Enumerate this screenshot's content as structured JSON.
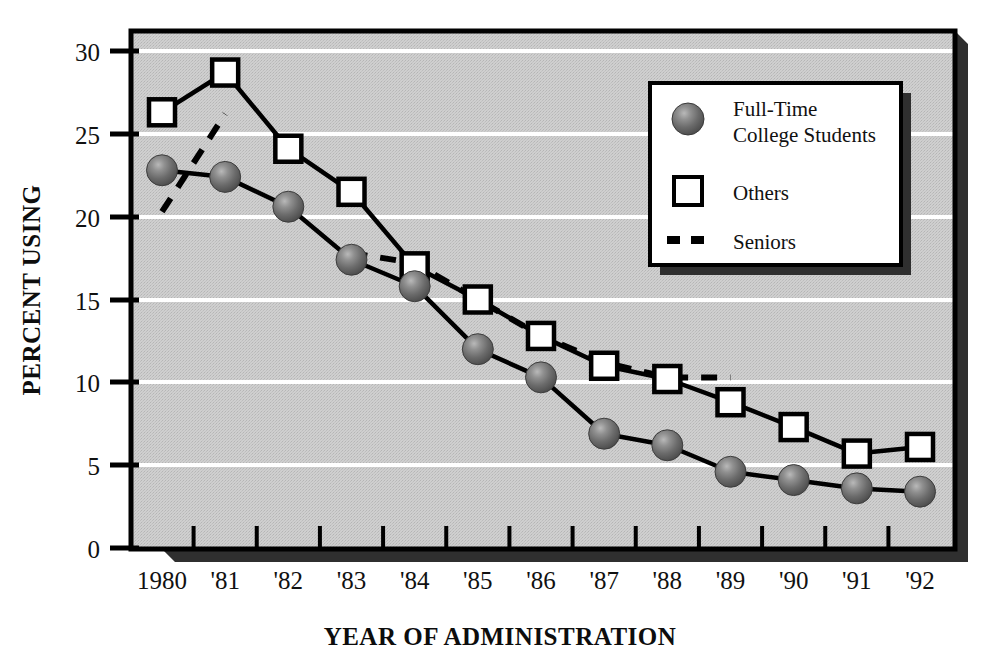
{
  "chart_data": {
    "type": "line",
    "title": "",
    "xlabel": "YEAR OF ADMINISTRATION",
    "ylabel": "PERCENT USING",
    "categories": [
      "1980",
      "'81",
      "'82",
      "'83",
      "'84",
      "'85",
      "'86",
      "'87",
      "'88",
      "'89",
      "'90",
      "'91",
      "'92"
    ],
    "x": [
      1980,
      1981,
      1982,
      1983,
      1984,
      1985,
      1986,
      1987,
      1988,
      1989,
      1990,
      1991,
      1992
    ],
    "ylim": [
      0,
      30
    ],
    "yticks": [
      0,
      5,
      10,
      15,
      20,
      25,
      30
    ],
    "ytick_labels": [
      "0",
      "5",
      "10",
      "15",
      "20",
      "25",
      "30"
    ],
    "grid": "horizontal-white",
    "legend_position": "upper-right-inset",
    "series": [
      {
        "name": "Full-Time College Students",
        "marker": "filled-sphere",
        "line": "solid",
        "values": [
          22.8,
          22.4,
          20.6,
          17.4,
          15.8,
          12.0,
          10.3,
          6.9,
          6.2,
          4.6,
          4.1,
          3.6,
          3.4
        ]
      },
      {
        "name": "Others",
        "marker": "open-square",
        "line": "solid",
        "values": [
          26.3,
          28.7,
          24.1,
          21.5,
          17.0,
          15.0,
          12.8,
          11.0,
          10.2,
          8.8,
          7.3,
          5.7,
          6.1
        ]
      },
      {
        "name": "Seniors",
        "marker": "none",
        "line": "dashed",
        "values": [
          20.3,
          26.2,
          null,
          17.8,
          17.2,
          15.0,
          12.8,
          11.2,
          10.3,
          10.3,
          null,
          null,
          6.1
        ]
      }
    ]
  },
  "axes": {
    "y_title": "PERCENT USING",
    "x_title": "YEAR OF ADMINISTRATION"
  },
  "legend": {
    "items": [
      {
        "label_line1": "Full-Time",
        "label_line2": "College Students",
        "marker": "filled-sphere"
      },
      {
        "label_line1": "Others",
        "label_line2": "",
        "marker": "open-square"
      },
      {
        "label_line1": "Seniors",
        "label_line2": "",
        "marker": "dashed-line"
      }
    ]
  },
  "colors": {
    "plot_background": "#c9c9c9",
    "gridline": "#ffffff",
    "series_line": "#000000",
    "marker_sphere": "#6e6e6e",
    "marker_square_fill": "#ffffff",
    "frame": "#000000",
    "shadow": "#2b2b2b",
    "page_background": "#ffffff"
  }
}
